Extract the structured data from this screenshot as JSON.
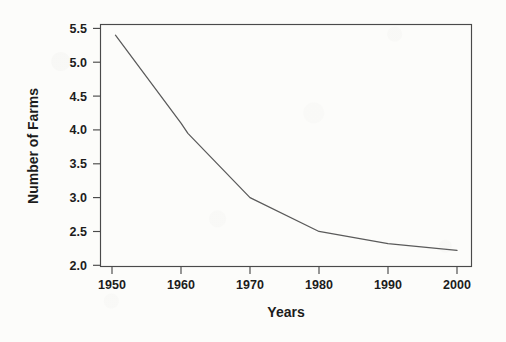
{
  "chart_data": {
    "type": "line",
    "title": "",
    "subtitle": "",
    "xlabel": "Years",
    "ylabel": "Number of Farms",
    "xlim": [
      1948,
      2003
    ],
    "ylim": [
      2.0,
      5.55
    ],
    "grid": false,
    "legend": false,
    "legend_position": "none",
    "x_ticks": [
      1950,
      1960,
      1970,
      1980,
      1990,
      2000
    ],
    "x_tick_labels": [
      "1950",
      "1960",
      "1970",
      "1980",
      "1990",
      "2000"
    ],
    "y_ticks": [
      2.0,
      2.5,
      3.0,
      3.5,
      4.0,
      4.5,
      5.0,
      5.5
    ],
    "y_tick_labels": [
      "2.0",
      "2.5",
      "3.0",
      "3.5",
      "4.0",
      "4.5",
      "5.0",
      "5.5"
    ],
    "line_color": "#5a5a5a",
    "frame_color": "#4a4a4a",
    "background_color": "#fcfcfa",
    "series": [
      {
        "name": "Number of Farms",
        "x": [
          1950.5,
          1960.0,
          1961.0,
          1970.0,
          1980.0,
          1990.0,
          2000.0
        ],
        "values": [
          5.4,
          4.1,
          3.95,
          3.0,
          2.5,
          2.32,
          2.22
        ]
      }
    ],
    "annotations": []
  },
  "axes": {
    "x_title": "Years",
    "y_title": "Number of Farms",
    "x_tick_labels": [
      "1950",
      "1960",
      "1970",
      "1980",
      "1990",
      "2000"
    ],
    "y_tick_labels": [
      "2.0",
      "2.5",
      "3.0",
      "3.5",
      "4.0",
      "4.5",
      "5.0",
      "5.5"
    ]
  }
}
